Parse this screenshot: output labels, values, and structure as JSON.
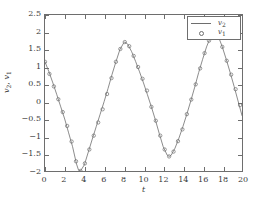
{
  "chart_data": {
    "type": "line",
    "title": "",
    "xlabel": "t",
    "ylabel": "v2, v1",
    "xlim": [
      0,
      20
    ],
    "ylim": [
      -2,
      2.5
    ],
    "grid": false,
    "legend_position": "upper right",
    "xticks": [
      0,
      2,
      4,
      6,
      8,
      10,
      12,
      14,
      16,
      18,
      20
    ],
    "xticklabels": [
      "0",
      "2",
      "4",
      "6",
      "8",
      "10",
      "12",
      "14",
      "16",
      "18",
      "20"
    ],
    "yticks": [
      -2,
      -1.5,
      -1,
      -0.5,
      0,
      0.5,
      1,
      1.5,
      2,
      2.5
    ],
    "yticklabels": [
      "-2",
      "-1.5",
      "-1",
      "-0.5",
      "0",
      "0.5",
      "1",
      "1.5",
      "2",
      "2.5"
    ],
    "series": [
      {
        "name": "v2",
        "style": "line",
        "color": "#6e6e6e",
        "x": [
          0,
          0.4,
          0.8,
          1.2,
          1.6,
          2,
          2.4,
          2.8,
          3.2,
          3.4,
          3.6,
          4,
          4.4,
          4.8,
          5.2,
          5.6,
          6,
          6.4,
          6.8,
          7.2,
          7.6,
          8,
          8.1,
          8.4,
          8.8,
          9.2,
          9.6,
          10,
          10.4,
          10.8,
          11.2,
          11.6,
          12,
          12.4,
          12.6,
          12.8,
          13.2,
          13.6,
          14,
          14.4,
          14.8,
          15.2,
          15.6,
          16,
          16.4,
          16.8,
          17.2,
          17.6,
          18,
          18.4,
          18.8,
          19.2,
          19.6,
          20
        ],
        "y": [
          1.15,
          0.86,
          0.54,
          0.2,
          -0.15,
          -0.5,
          -0.9,
          -1.3,
          -1.8,
          -1.97,
          -2.0,
          -1.82,
          -1.45,
          -1.08,
          -0.72,
          -0.36,
          0.0,
          0.38,
          0.78,
          1.15,
          1.5,
          1.7,
          1.72,
          1.66,
          1.44,
          1.16,
          0.86,
          0.54,
          0.2,
          -0.15,
          -0.52,
          -0.92,
          -1.3,
          -1.54,
          -1.58,
          -1.55,
          -1.34,
          -1.05,
          -0.72,
          -0.36,
          0.02,
          0.42,
          0.84,
          1.22,
          1.58,
          1.86,
          2.0,
          1.88,
          1.58,
          1.22,
          0.84,
          0.44,
          0.02,
          -0.4
        ]
      },
      {
        "name": "v1",
        "style": "markers",
        "marker": "circle",
        "color": "#6e6e6e",
        "x": [
          0,
          0.45,
          0.9,
          1.35,
          1.8,
          2.25,
          2.7,
          3.15,
          3.6,
          4.05,
          4.5,
          4.95,
          5.4,
          5.85,
          6.3,
          6.75,
          7.2,
          7.65,
          8.1,
          8.55,
          9,
          9.45,
          9.9,
          10.35,
          10.8,
          11.25,
          11.7,
          12.15,
          12.6,
          13.05,
          13.5,
          13.95,
          14.4,
          14.85,
          15.3,
          15.75,
          16.2,
          16.65,
          17.1,
          17.55,
          18,
          18.45,
          18.9,
          19.35,
          19.8
        ],
        "y": [
          1.15,
          0.8,
          0.44,
          0.07,
          -0.3,
          -0.7,
          -1.15,
          -1.72,
          -2.0,
          -1.78,
          -1.38,
          -0.98,
          -0.6,
          -0.22,
          0.22,
          0.68,
          1.15,
          1.52,
          1.72,
          1.6,
          1.32,
          1.0,
          0.66,
          0.32,
          -0.15,
          -0.55,
          -0.98,
          -1.38,
          -1.58,
          -1.44,
          -1.14,
          -0.8,
          -0.36,
          0.06,
          0.5,
          0.96,
          1.4,
          1.76,
          1.99,
          1.92,
          1.58,
          1.18,
          0.78,
          0.36,
          -0.1
        ]
      }
    ],
    "legend_entries": [
      {
        "label": "v2",
        "label_base": "v",
        "label_sub": "2",
        "style": "line"
      },
      {
        "label": "v1",
        "label_base": "v",
        "label_sub": "1",
        "style": "circle"
      }
    ],
    "ylabel_parts": {
      "base1": "v",
      "sub1": "2",
      "sep": ", ",
      "base2": "v",
      "sub2": "1"
    }
  },
  "colors": {
    "axis": "#6e6e6e",
    "curve": "#6e6e6e",
    "text": "#3a3a3a",
    "background": "#ffffff"
  }
}
